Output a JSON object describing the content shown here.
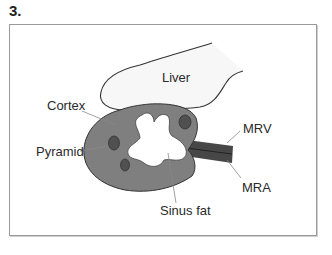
{
  "figure": {
    "number": "3.",
    "labels": {
      "liver": "Liver",
      "cortex": "Cortex",
      "pyramid": "Pyramid",
      "sinus_fat": "Sinus fat",
      "mrv": "MRV",
      "mra": "MRA"
    },
    "colors": {
      "kidney_cortex": "#7f7f7f",
      "pyramid": "#505050",
      "vessels": "#444444",
      "liver_fill": "#f7f7f7",
      "outline": "#333333"
    }
  }
}
